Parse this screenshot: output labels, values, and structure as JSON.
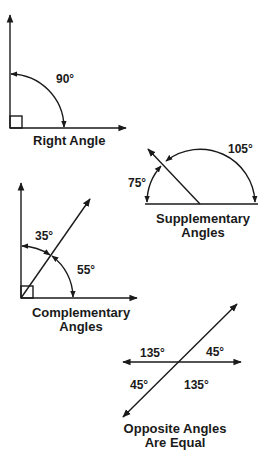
{
  "diagrams": {
    "right_angle": {
      "caption": "Right Angle",
      "angle_label": "90°"
    },
    "supplementary": {
      "caption_line1": "Supplementary",
      "caption_line2": "Angles",
      "angle_large": "105°",
      "angle_small": "75°"
    },
    "complementary": {
      "caption_line1": "Complementary",
      "caption_line2": "Angles",
      "angle_upper": "35°",
      "angle_lower": "55°"
    },
    "opposite": {
      "caption_line1": "Opposite Angles",
      "caption_line2": "Are Equal",
      "top_left": "135°",
      "top_right": "45°",
      "bottom_left": "45°",
      "bottom_right": "135°"
    }
  },
  "colors": {
    "ink": "#1a1a1a",
    "background": "#ffffff"
  }
}
